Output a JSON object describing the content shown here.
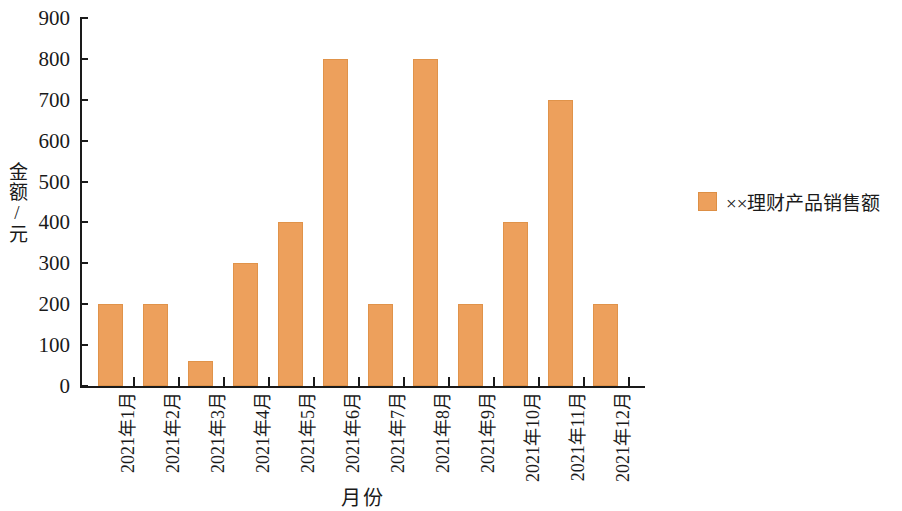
{
  "chart_data": {
    "type": "bar",
    "title": "",
    "subtitle": "",
    "xlabel": "月份",
    "ylabel": "金额/元",
    "categories": [
      "2021年1月",
      "2021年2月",
      "2021年3月",
      "2021年4月",
      "2021年5月",
      "2021年6月",
      "2021年7月",
      "2021年8月",
      "2021年9月",
      "2021年10月",
      "2021年11月",
      "2021年12月"
    ],
    "values": [
      200,
      200,
      60,
      300,
      400,
      800,
      200,
      800,
      200,
      400,
      700,
      200
    ],
    "series": [
      {
        "name": "××理财产品销售额",
        "color": "#eda05c",
        "values": [
          200,
          200,
          60,
          300,
          400,
          800,
          200,
          800,
          200,
          400,
          700,
          200
        ]
      }
    ],
    "ylim": [
      0,
      900
    ],
    "ytick_step": 100,
    "ytick_labels": [
      "0",
      "100",
      "200",
      "300",
      "400",
      "500",
      "600",
      "700",
      "800",
      "900"
    ],
    "grid": false,
    "legend_position": "right",
    "legend": [
      "××理财产品销售额"
    ]
  },
  "legend": {
    "entries": [
      {
        "label": "××理财产品销售额",
        "color": "#eda05c"
      }
    ]
  },
  "axes": {
    "y_title": "金额/元",
    "x_title": "月份"
  },
  "colors": {
    "bar": "#eda05c",
    "bar_edge": "#e0934a",
    "axis": "#1a1a1a",
    "background": "#ffffff"
  }
}
